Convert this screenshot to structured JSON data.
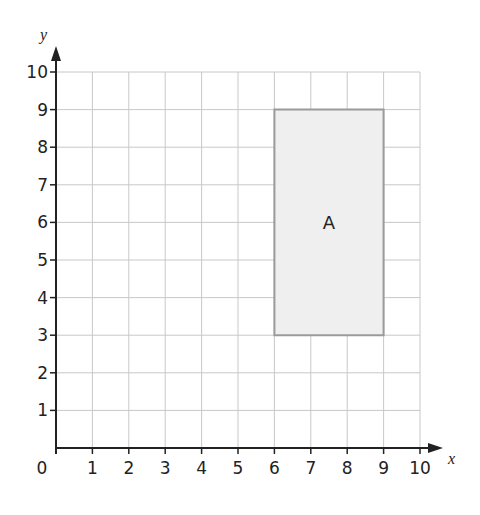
{
  "chart_data": {
    "type": "coordinate-grid",
    "xlabel": "x",
    "ylabel": "y",
    "xlim": [
      0,
      10
    ],
    "ylim": [
      0,
      10
    ],
    "x_ticks": [
      "1",
      "2",
      "3",
      "4",
      "5",
      "6",
      "7",
      "8",
      "9",
      "10"
    ],
    "y_ticks": [
      "1",
      "2",
      "3",
      "4",
      "5",
      "6",
      "7",
      "8",
      "9",
      "10"
    ],
    "origin_label": "0",
    "grid": true,
    "shapes": [
      {
        "label": "A",
        "type": "rectangle",
        "vertices": [
          [
            6,
            3
          ],
          [
            9,
            3
          ],
          [
            9,
            9
          ],
          [
            6,
            9
          ]
        ],
        "fill": "#efefef",
        "stroke": "#9a9a9a"
      }
    ]
  },
  "colors": {
    "grid": "#c8c8c8",
    "axis": "#222222",
    "shape_fill": "#efefef",
    "shape_stroke": "#9a9a9a"
  }
}
